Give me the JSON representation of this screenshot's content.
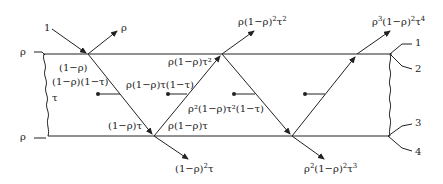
{
  "diagram": {
    "stroke_color": "#222222",
    "left_labels": {
      "top_surface": "ρ",
      "bottom_surface": "ρ",
      "thickness": "τ"
    },
    "incident": {
      "label": "1"
    },
    "reflected_first": {
      "label": "ρ"
    },
    "inside_labels": {
      "entry": "(1−ρ)",
      "absorbed_first": "(1−ρ)(1−τ)",
      "arriving_bottom": "(1−ρ)τ",
      "reflected_bottom": "ρ(1−ρ)τ",
      "absorbed_second": "ρ(1−ρ)τ(1−τ)",
      "arriving_top": "ρ(1−ρ)τ²",
      "absorbed_third": "ρ²(1−ρ)τ²(1−τ)"
    },
    "outputs": {
      "transmitted_1": {
        "base": "(1−ρ)",
        "sup1": "2",
        "tail": "τ"
      },
      "reflected_2": {
        "pre": "ρ(1−ρ)",
        "sup1": "2",
        "mid": "τ",
        "sup2": "2"
      },
      "transmitted_2": {
        "pre": "ρ",
        "sup0": "2",
        "mid0": "(1−ρ)",
        "sup1": "2",
        "mid": "τ",
        "sup2": "3"
      },
      "reflected_3": {
        "pre": "ρ",
        "sup0": "3",
        "mid0": "(1−ρ)",
        "sup1": "2",
        "mid": "τ",
        "sup2": "4"
      }
    },
    "right_callouts": [
      "1",
      "2",
      "3",
      "4"
    ]
  }
}
